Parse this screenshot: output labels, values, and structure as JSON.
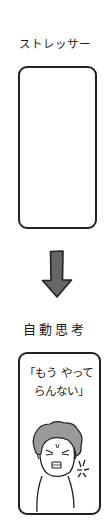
{
  "diagram": {
    "top_label": "ストレッサー",
    "top_panel": {
      "content": ""
    },
    "arrow": {
      "direction": "down",
      "fill": "#666666",
      "stroke": "#222222"
    },
    "bottom_label": "自動思考",
    "bottom_panel": {
      "speech_line1": "「もう やって",
      "speech_line2": "らんない」",
      "figure": "angry-person",
      "hair_color": "#9a9a9a",
      "anger_mark": true
    }
  }
}
